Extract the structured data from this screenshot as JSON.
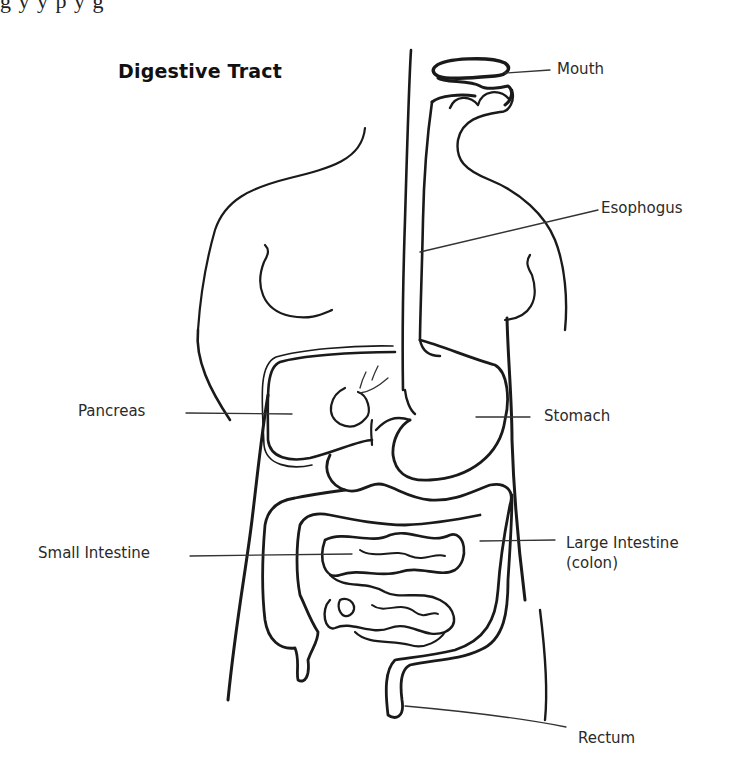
{
  "top_clipped_text": "g y y p y g",
  "diagram": {
    "title": "Digestive Tract",
    "labels": [
      {
        "id": "mouth",
        "text": "Mouth"
      },
      {
        "id": "esophagus",
        "text": "Esophogus"
      },
      {
        "id": "pancreas",
        "text": "Pancreas"
      },
      {
        "id": "stomach",
        "text": "Stomach"
      },
      {
        "id": "small-intestine",
        "text": "Small Intestine"
      },
      {
        "id": "large-intestine",
        "text": "Large Intestine",
        "subtext": "(colon)"
      },
      {
        "id": "rectum",
        "text": "Rectum"
      }
    ]
  }
}
